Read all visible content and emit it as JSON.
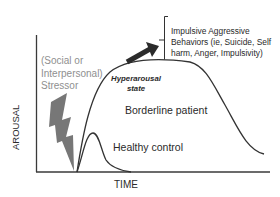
{
  "diagram": {
    "axes": {
      "x_label": "TIME",
      "y_label": "AROUSAL"
    },
    "stressor": {
      "label": "(Social or\nInterpersonal)\nStressor",
      "icon": "lightning-bolt-icon"
    },
    "curves": [
      {
        "name": "Borderline patient",
        "state_label": "Hyperarousal\nstate"
      },
      {
        "name": "Healthy control"
      }
    ],
    "outcome": {
      "label": "Impulsive Aggressive\nBehaviors (ie, Suicide, Self\nharm, Anger, Impulsivity)",
      "icon": "arrow-up-right-icon"
    },
    "colors": {
      "curve": "#333333",
      "stressor_text": "#8f8f8f",
      "bolt": "#777777",
      "arrow": "#2b2b2b"
    }
  }
}
